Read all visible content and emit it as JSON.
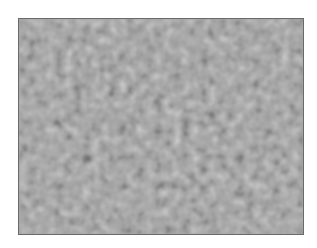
{
  "image": {
    "description": "grayscale blurred labyrinthine noise texture",
    "frame": {
      "x": 18,
      "y": 18,
      "width": 286,
      "height": 217,
      "border_color": "#6a6a6a"
    },
    "colors": {
      "base_gray": "#a8a8a8",
      "highlight": "#f2f2f2",
      "shadow": "#3a3a3a",
      "background": "#ffffff"
    }
  }
}
